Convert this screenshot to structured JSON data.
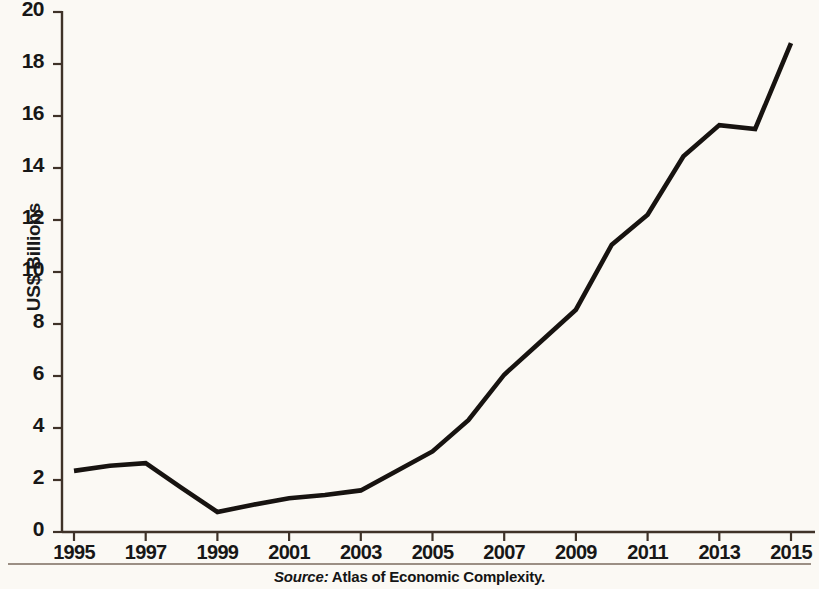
{
  "chart_data": {
    "type": "line",
    "title": "",
    "subtitle": "",
    "xlabel": "",
    "ylabel": "US$ Billions",
    "xlim": [
      1995,
      2015
    ],
    "ylim": [
      0,
      20
    ],
    "grid": false,
    "legend": null,
    "line_color": "#171310",
    "background_color": "#fbf9f4",
    "x": [
      1995,
      1996,
      1997,
      1998,
      1999,
      2000,
      2001,
      2002,
      2003,
      2004,
      2005,
      2006,
      2007,
      2008,
      2009,
      2010,
      2011,
      2012,
      2013,
      2014,
      2015
    ],
    "values": [
      2.35,
      2.55,
      2.65,
      1.7,
      0.77,
      1.05,
      1.3,
      1.42,
      1.6,
      2.35,
      3.1,
      4.3,
      6.05,
      7.3,
      8.55,
      11.05,
      12.2,
      14.45,
      15.65,
      15.5,
      18.8
    ],
    "series": [
      {
        "name": "Exports",
        "values": [
          2.35,
          2.55,
          2.65,
          1.7,
          0.77,
          1.05,
          1.3,
          1.42,
          1.6,
          2.35,
          3.1,
          4.3,
          6.05,
          7.3,
          8.55,
          11.05,
          12.2,
          14.45,
          15.65,
          15.5,
          18.8
        ]
      }
    ],
    "yticks": [
      0,
      2,
      4,
      6,
      8,
      10,
      12,
      14,
      16,
      18,
      20
    ],
    "ytick_labels": [
      "0",
      "2",
      "4",
      "6",
      "8",
      "10",
      "12",
      "14",
      "16",
      "18",
      "20"
    ],
    "xticks": [
      1995,
      1997,
      1999,
      2001,
      2003,
      2005,
      2007,
      2009,
      2011,
      2013,
      2015
    ],
    "xtick_labels": [
      "1995",
      "1997",
      "1999",
      "2001",
      "2003",
      "2005",
      "2007",
      "2009",
      "2011",
      "2013",
      "2015"
    ]
  },
  "axis": {
    "y_title": "US$ Billions",
    "y_labels": [
      "20",
      "18",
      "16",
      "14",
      "12",
      "10",
      "8",
      "6",
      "4",
      "2",
      "0"
    ],
    "x_labels": [
      "1995",
      "1997",
      "1999",
      "2001",
      "2003",
      "2005",
      "2007",
      "2009",
      "2011",
      "2013",
      "2015"
    ]
  },
  "footer": {
    "source_label": "Source:",
    "source_text": "Atlas of Economic Complexity."
  }
}
